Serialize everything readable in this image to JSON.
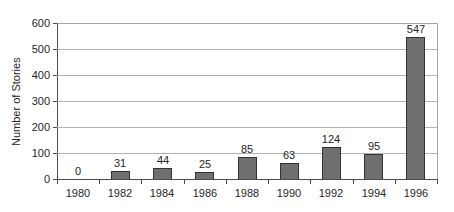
{
  "chart_data": {
    "type": "bar",
    "title": "",
    "xlabel": "",
    "ylabel": "Number of Stories",
    "categories": [
      "1980",
      "1982",
      "1984",
      "1986",
      "1988",
      "1990",
      "1992",
      "1994",
      "1996"
    ],
    "values": [
      0,
      31,
      44,
      25,
      85,
      63,
      124,
      95,
      547
    ],
    "value_labels": [
      "0",
      "31",
      "44",
      "25",
      "85",
      "63",
      "124",
      "95",
      "547"
    ],
    "ylim": [
      0,
      600
    ],
    "yticks": [
      600,
      500,
      400,
      300,
      200,
      100,
      0
    ],
    "grid": true,
    "legend": "none"
  },
  "colors": {
    "background": "#ffffff",
    "bar_fill": "#6f6f6f",
    "bar_border": "#333333",
    "gridline": "#b3b3b3",
    "plot_border": "#a6a6a6",
    "axis": "#4d4d4d",
    "text": "#262626"
  }
}
